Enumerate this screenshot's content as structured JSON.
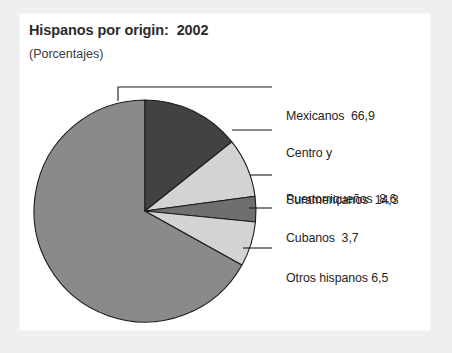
{
  "figure": {
    "title": "Hispanos por origin:  2002",
    "subtitle": "(Porcentajes)",
    "background_color": "#efefef",
    "card_color": "#ffffff"
  },
  "chart_data": {
    "type": "pie",
    "title": "Hispanos por origin:  2002",
    "subtitle": "(Porcentajes)",
    "xlabel": "",
    "ylabel": "",
    "units": "percent",
    "value_decimal_separator": ",",
    "start_angle_deg": 0,
    "direction": "clockwise",
    "legend": "none",
    "grid": false,
    "categories": [
      "Centro y Suramericanos",
      "Puertorriqueños",
      "Cubanos",
      "Otros hispanos",
      "Mexicanos"
    ],
    "values": [
      14.3,
      8.6,
      3.7,
      6.5,
      66.9
    ],
    "colors": [
      "#424242",
      "#d3d3d3",
      "#6f6f6f",
      "#d3d3d3",
      "#8a8a8a"
    ],
    "slices": [
      {
        "name": "Centro y Suramericanos",
        "label_line_1": "Centro y",
        "label_line_2": "Suramericanos  14,3",
        "value": 14.3,
        "value_text": "14,3",
        "color": "#424242",
        "start_deg": 0.0,
        "end_deg": 51.5
      },
      {
        "name": "Puertorriqueños",
        "label_line_1": "Puertorriqueños  8,6",
        "label_line_2": "",
        "value": 8.6,
        "value_text": "8,6",
        "color": "#d3d3d3",
        "start_deg": 51.5,
        "end_deg": 82.4
      },
      {
        "name": "Cubanos",
        "label_line_1": "Cubanos  3,7",
        "label_line_2": "",
        "value": 3.7,
        "value_text": "3,7",
        "color": "#6f6f6f",
        "start_deg": 82.4,
        "end_deg": 95.7
      },
      {
        "name": "Otros hispanos",
        "label_line_1": "Otros hispanos 6,5",
        "label_line_2": "",
        "value": 6.5,
        "value_text": "6,5",
        "color": "#d3d3d3",
        "start_deg": 95.7,
        "end_deg": 119.1
      },
      {
        "name": "Mexicanos",
        "label_line_1": "Mexicanos  66,9",
        "label_line_2": "",
        "value": 66.9,
        "value_text": "66,9",
        "color": "#8a8a8a",
        "start_deg": 119.1,
        "end_deg": 360.0
      }
    ]
  }
}
